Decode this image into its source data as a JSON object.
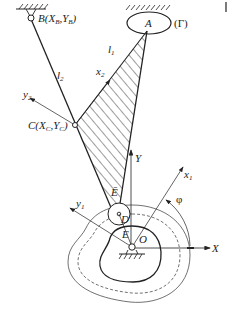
{
  "figure": {
    "type": "mechanism-diagram"
  },
  "labels": {
    "B": "B",
    "B_coords": "(X",
    "B_sub_x": "B",
    "B_sep": ",Y",
    "B_sub_y": "B",
    "B_close": ")",
    "A": "A",
    "gamma": "(Γ)",
    "l1": "l",
    "l1_sub": "1",
    "l2": "l",
    "l2_sub": "2",
    "x2": "x",
    "x2_sub": "2",
    "y2": "y",
    "y2_sub": "2",
    "C": "C(X",
    "C_sub_x": "C",
    "C_sep": ",Y",
    "C_sub_y": "C",
    "C_close": ")",
    "E_bar": "Ē",
    "Y": "Y",
    "x1": "x",
    "x1_sub": "1",
    "phi": "φ",
    "y1": "y",
    "y1_sub": "1",
    "D": "D",
    "E": "E",
    "O": "O",
    "X": "X"
  },
  "colors": {
    "stroke": "#222222",
    "background": "#ffffff"
  }
}
